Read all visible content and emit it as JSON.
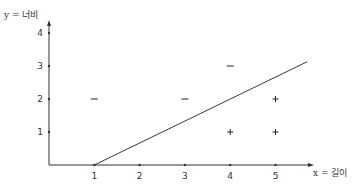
{
  "chart_data": {
    "type": "scatter",
    "title": "",
    "xlabel": "x = 길이",
    "ylabel": "y = 너비",
    "xlim": [
      0,
      5.7
    ],
    "ylim": [
      0,
      4.4
    ],
    "x_ticks": [
      "1",
      "2",
      "3",
      "4",
      "5"
    ],
    "y_ticks": [
      "1",
      "2",
      "3",
      "4"
    ],
    "grid": false,
    "legend": null,
    "series": [
      {
        "name": "negative",
        "marker": "−",
        "points": [
          [
            1,
            2
          ],
          [
            3,
            2
          ],
          [
            4,
            3
          ]
        ]
      },
      {
        "name": "positive",
        "marker": "+",
        "points": [
          [
            4,
            1
          ],
          [
            5,
            1
          ],
          [
            5,
            2
          ]
        ]
      }
    ],
    "decision_boundary": {
      "type": "line",
      "from": [
        1,
        0
      ],
      "to": [
        5.7,
        3.13
      ],
      "slope": 0.667
    }
  },
  "labels": {
    "x_axis": "x = 길이",
    "y_axis": "y = 너비",
    "minus": "−",
    "plus": "+"
  }
}
